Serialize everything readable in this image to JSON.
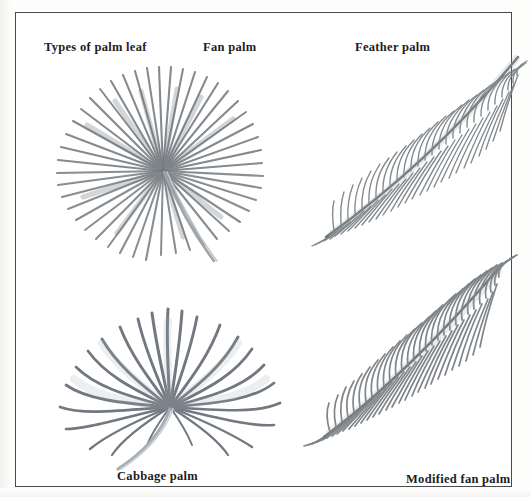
{
  "figure": {
    "title": "Types of palm leaf",
    "background_color": "#ffffff",
    "frame_color": "#4a4a4a",
    "ink_color": "#5a5f63",
    "caption_color": "#1d1d1d"
  },
  "captions": {
    "types_of_palm_leaf": "Types of palm leaf",
    "fan_palm": "Fan palm",
    "feather_palm": "Feather palm",
    "cabbage_palm": "Cabbage palm",
    "modified_fan_palm": "Modified fan palm"
  },
  "illustrations": [
    {
      "name": "fan-palm",
      "label": "Fan palm",
      "description": "Radially pleated circular fan of many narrow stiff segments radiating from a single hub, with a long curving petiole descending to the lower right.",
      "segment_count": 44,
      "position": "top-left"
    },
    {
      "name": "feather-palm",
      "label": "Feather palm",
      "description": "Pinnate frond with a straight rachis running diagonally from lower left to upper right, bearing many slender leaflets on both sides.",
      "leaflet_count": 78,
      "position": "top-right"
    },
    {
      "name": "cabbage-palm",
      "label": "Cabbage palm",
      "description": "Costapalmate fan of broader drooping segments arching downward from a central hub with a short stout petiole.",
      "segment_count": 26,
      "position": "bottom-left"
    },
    {
      "name": "modified-fan-palm",
      "label": "Modified fan palm",
      "description": "Dense plume-like frond with closely set leaflets along a curving rachis from lower left to upper right.",
      "leaflet_count": 96,
      "position": "bottom-right"
    }
  ]
}
